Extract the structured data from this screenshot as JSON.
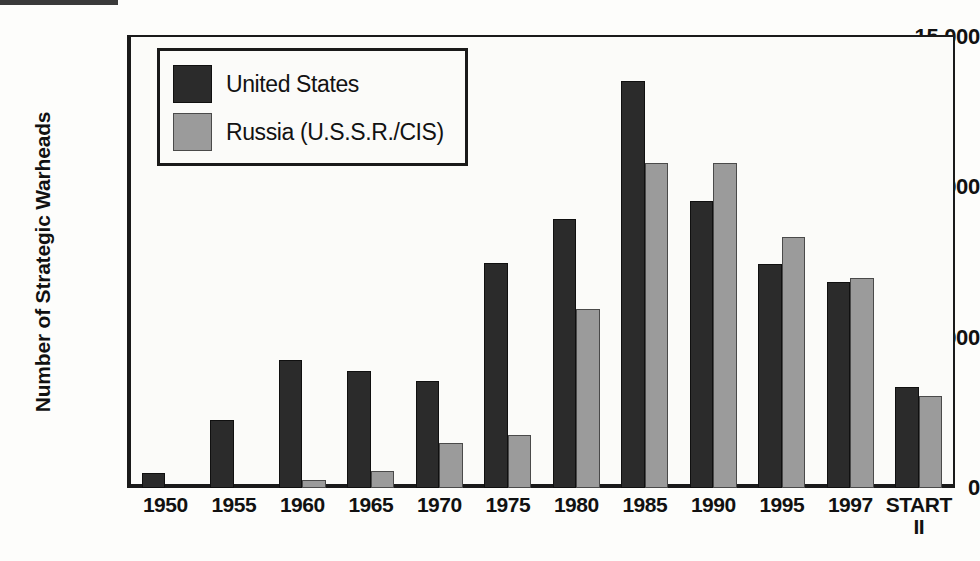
{
  "chart_data": {
    "type": "bar",
    "title": "",
    "xlabel": "",
    "ylabel": "Number of Strategic Warheads",
    "ylim": [
      0,
      15000
    ],
    "yticks": [
      0,
      5000,
      10000,
      15000
    ],
    "ytick_labels": [
      "0",
      "5,000",
      "10,000",
      "15,000"
    ],
    "grid": false,
    "legend_position": "upper left",
    "categories": [
      "1950",
      "1955",
      "1960",
      "1965",
      "1970",
      "1975",
      "1980",
      "1985",
      "1990",
      "1995",
      "1997",
      "START\nII"
    ],
    "series": [
      {
        "name": "United States",
        "color": "#2b2b2b",
        "values": [
          500,
          2250,
          4250,
          3900,
          3550,
          7500,
          8950,
          13550,
          9550,
          7450,
          6850,
          3350
        ]
      },
      {
        "name": "Russia (U.S.S.R./CIS)",
        "color": "#9b9b9b",
        "values": [
          0,
          0,
          250,
          550,
          1500,
          1750,
          5950,
          10800,
          10800,
          8350,
          7000,
          3050
        ]
      }
    ]
  },
  "legend": {
    "items": [
      {
        "label": "United States",
        "swatch": "us"
      },
      {
        "label": "Russia (U.S.S.R./CIS)",
        "swatch": "ru"
      }
    ]
  },
  "axes": {
    "y_title": "Number of Strategic Warheads"
  }
}
